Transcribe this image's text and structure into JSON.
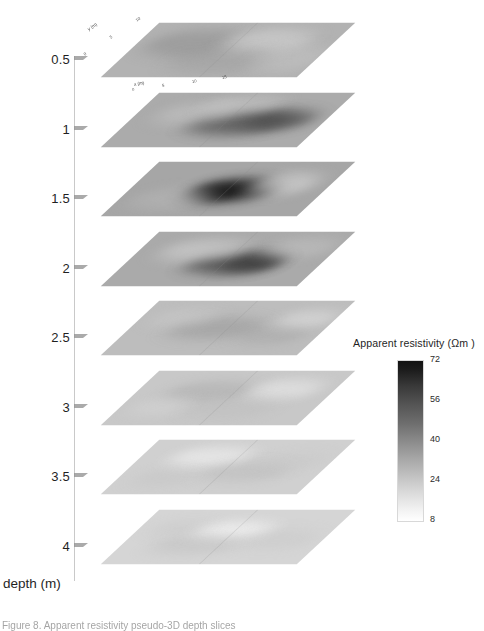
{
  "figure": {
    "domain": "scientific-figure",
    "kind": "stacked-depth-slices",
    "caption": "Figure 8.   Apparent resistivity pseudo-3D depth slices"
  },
  "depth_axis": {
    "title": "depth (m)",
    "ticks": [
      "0.5",
      "1",
      "1.5",
      "2",
      "2.5",
      "3",
      "3.5",
      "4"
    ]
  },
  "plan_axes": {
    "x_title": "x (m)",
    "y_title": "y (m)",
    "x_ticks": [
      "0",
      "5",
      "10",
      "15"
    ],
    "y_ticks": [
      "0",
      "5",
      "10"
    ]
  },
  "colorbar": {
    "title": "Apparent resistivity (Ωm )",
    "ticks": [
      "72",
      "56",
      "40",
      "24",
      "8"
    ],
    "high_color": "#121212",
    "low_color": "#ffffff"
  },
  "chart_data": {
    "type": "heatmap",
    "title": "Apparent resistivity (Ωm )",
    "xlabel": "x (m)",
    "ylabel": "y (m)",
    "zlabel": "depth (m)",
    "clabel": "Apparent resistivity (Ωm )",
    "clim": [
      8,
      72
    ],
    "grid": false,
    "legend_position": "right",
    "depth_levels": [
      0.5,
      1,
      1.5,
      2,
      2.5,
      3,
      3.5,
      4
    ],
    "slices": [
      {
        "depth": 0.5,
        "tick_label": "0.5",
        "mean_resistivity": 40,
        "max_resistivity": 58,
        "min_resistivity": 20,
        "base_tone": "#b2b2b2",
        "anomalies": [
          {
            "cx": 58,
            "cy": 34,
            "rx": 48,
            "ry": 22,
            "tone": "#8e8e8e",
            "strength": 0.55
          },
          {
            "cx": 128,
            "cy": 30,
            "rx": 44,
            "ry": 20,
            "tone": "#d8d8d8",
            "strength": 0.5
          },
          {
            "cx": 104,
            "cy": 62,
            "rx": 52,
            "ry": 20,
            "tone": "#9c9c9c",
            "strength": 0.45
          },
          {
            "cx": 168,
            "cy": 58,
            "rx": 36,
            "ry": 22,
            "tone": "#c9c9c9",
            "strength": 0.4
          }
        ]
      },
      {
        "depth": 1,
        "tick_label": "1",
        "mean_resistivity": 46,
        "max_resistivity": 70,
        "min_resistivity": 22,
        "base_tone": "#ababab",
        "anomalies": [
          {
            "cx": 112,
            "cy": 48,
            "rx": 50,
            "ry": 20,
            "tone": "#575757",
            "strength": 0.8
          },
          {
            "cx": 150,
            "cy": 44,
            "rx": 34,
            "ry": 16,
            "tone": "#4a4a4a",
            "strength": 0.7
          },
          {
            "cx": 60,
            "cy": 34,
            "rx": 40,
            "ry": 18,
            "tone": "#c6c6c6",
            "strength": 0.5
          },
          {
            "cx": 96,
            "cy": 20,
            "rx": 38,
            "ry": 14,
            "tone": "#d2d2d2",
            "strength": 0.45
          }
        ]
      },
      {
        "depth": 1.5,
        "tick_label": "1.5",
        "mean_resistivity": 50,
        "max_resistivity": 76,
        "min_resistivity": 24,
        "base_tone": "#a6a6a6",
        "anomalies": [
          {
            "cx": 104,
            "cy": 46,
            "rx": 44,
            "ry": 19,
            "tone": "#3c3c3c",
            "strength": 0.92
          },
          {
            "cx": 96,
            "cy": 48,
            "rx": 24,
            "ry": 11,
            "tone": "#141414",
            "strength": 1.0
          },
          {
            "cx": 150,
            "cy": 36,
            "rx": 32,
            "ry": 18,
            "tone": "#dcdcdc",
            "strength": 0.55
          },
          {
            "cx": 52,
            "cy": 60,
            "rx": 40,
            "ry": 18,
            "tone": "#bdbdbd",
            "strength": 0.4
          }
        ]
      },
      {
        "depth": 2,
        "tick_label": "2",
        "mean_resistivity": 46,
        "max_resistivity": 68,
        "min_resistivity": 22,
        "base_tone": "#aaaaaa",
        "anomalies": [
          {
            "cx": 108,
            "cy": 50,
            "rx": 46,
            "ry": 18,
            "tone": "#4f4f4f",
            "strength": 0.85
          },
          {
            "cx": 128,
            "cy": 52,
            "rx": 28,
            "ry": 12,
            "tone": "#3a3a3a",
            "strength": 0.8
          },
          {
            "cx": 64,
            "cy": 30,
            "rx": 42,
            "ry": 18,
            "tone": "#d4d4d4",
            "strength": 0.55
          },
          {
            "cx": 160,
            "cy": 26,
            "rx": 34,
            "ry": 16,
            "tone": "#c8c8c8",
            "strength": 0.45
          }
        ]
      },
      {
        "depth": 2.5,
        "tick_label": "2.5",
        "mean_resistivity": 36,
        "max_resistivity": 54,
        "min_resistivity": 18,
        "base_tone": "#bdbdbd",
        "anomalies": [
          {
            "cx": 86,
            "cy": 44,
            "rx": 46,
            "ry": 18,
            "tone": "#9a9a9a",
            "strength": 0.6
          },
          {
            "cx": 150,
            "cy": 54,
            "rx": 34,
            "ry": 16,
            "tone": "#a4a4a4",
            "strength": 0.5
          },
          {
            "cx": 168,
            "cy": 30,
            "rx": 30,
            "ry": 14,
            "tone": "#e6e6e6",
            "strength": 0.5
          },
          {
            "cx": 44,
            "cy": 28,
            "rx": 32,
            "ry": 14,
            "tone": "#d0d0d0",
            "strength": 0.4
          }
        ]
      },
      {
        "depth": 3,
        "tick_label": "3",
        "mean_resistivity": 30,
        "max_resistivity": 46,
        "min_resistivity": 14,
        "base_tone": "#c8c8c8",
        "anomalies": [
          {
            "cx": 74,
            "cy": 34,
            "rx": 44,
            "ry": 16,
            "tone": "#a8a8a8",
            "strength": 0.5
          },
          {
            "cx": 146,
            "cy": 30,
            "rx": 36,
            "ry": 16,
            "tone": "#ededed",
            "strength": 0.55
          },
          {
            "cx": 112,
            "cy": 62,
            "rx": 44,
            "ry": 16,
            "tone": "#bbbbbb",
            "strength": 0.4
          },
          {
            "cx": 40,
            "cy": 58,
            "rx": 28,
            "ry": 14,
            "tone": "#dddddd",
            "strength": 0.35
          }
        ]
      },
      {
        "depth": 3.5,
        "tick_label": "3.5",
        "mean_resistivity": 26,
        "max_resistivity": 40,
        "min_resistivity": 12,
        "base_tone": "#d0d0d0",
        "anomalies": [
          {
            "cx": 70,
            "cy": 28,
            "rx": 40,
            "ry": 16,
            "tone": "#f2f2f2",
            "strength": 0.6
          },
          {
            "cx": 120,
            "cy": 52,
            "rx": 44,
            "ry": 16,
            "tone": "#b6b6b6",
            "strength": 0.45
          },
          {
            "cx": 158,
            "cy": 34,
            "rx": 32,
            "ry": 14,
            "tone": "#c4c4c4",
            "strength": 0.35
          },
          {
            "cx": 46,
            "cy": 62,
            "rx": 30,
            "ry": 14,
            "tone": "#bfbfbf",
            "strength": 0.35
          }
        ]
      },
      {
        "depth": 4,
        "tick_label": "4",
        "mean_resistivity": 24,
        "max_resistivity": 38,
        "min_resistivity": 10,
        "base_tone": "#d5d5d5",
        "anomalies": [
          {
            "cx": 96,
            "cy": 34,
            "rx": 40,
            "ry": 14,
            "tone": "#fafafa",
            "strength": 0.65
          },
          {
            "cx": 74,
            "cy": 56,
            "rx": 44,
            "ry": 16,
            "tone": "#bcbcbc",
            "strength": 0.45
          },
          {
            "cx": 150,
            "cy": 48,
            "rx": 40,
            "ry": 16,
            "tone": "#c6c6c6",
            "strength": 0.4
          },
          {
            "cx": 40,
            "cy": 30,
            "rx": 28,
            "ry": 12,
            "tone": "#c0c0c0",
            "strength": 0.3
          }
        ]
      }
    ]
  }
}
